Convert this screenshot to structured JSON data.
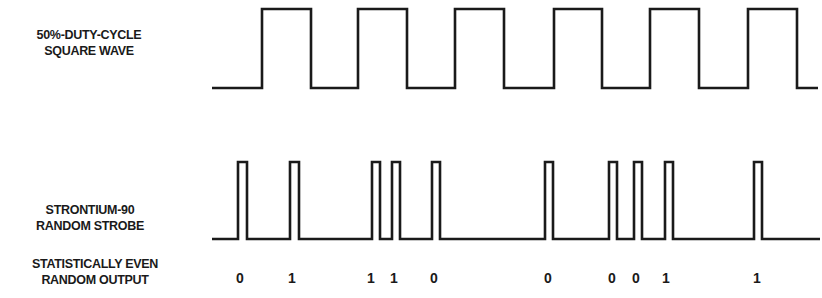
{
  "labels": {
    "square_wave": [
      "50%-DUTY-CYCLE",
      "SQUARE WAVE"
    ],
    "strobe": [
      "STRONTIUM-90",
      "RANDOM STROBE"
    ],
    "output": [
      "STATISTICALLY EVEN",
      "RANDOM OUTPUT"
    ]
  },
  "square_wave": {
    "start_x": 212,
    "end_x": 818,
    "low_y": 88,
    "high_y": 9,
    "edges": [
      262,
      311,
      358,
      407,
      455,
      504,
      554,
      602,
      650,
      699,
      748,
      797
    ]
  },
  "strobe": {
    "start_x": 212,
    "end_x": 820,
    "low_y": 239,
    "high_y": 162,
    "pulses": [
      [
        238,
        247
      ],
      [
        290,
        299
      ],
      [
        372,
        380
      ],
      [
        392,
        400
      ],
      [
        432,
        440
      ],
      [
        545,
        553
      ],
      [
        609,
        617
      ],
      [
        634,
        642
      ],
      [
        665,
        673
      ],
      [
        754,
        762
      ]
    ]
  },
  "output_bits": [
    {
      "x": 240,
      "value": "0"
    },
    {
      "x": 292,
      "value": "1"
    },
    {
      "x": 371,
      "value": "1"
    },
    {
      "x": 394,
      "value": "1"
    },
    {
      "x": 434,
      "value": "0"
    },
    {
      "x": 548,
      "value": "0"
    },
    {
      "x": 612,
      "value": "0"
    },
    {
      "x": 636,
      "value": "0"
    },
    {
      "x": 666,
      "value": "1"
    },
    {
      "x": 757,
      "value": "1"
    }
  ],
  "colors": {
    "ink": "#1a1a1a",
    "background": "#ffffff"
  }
}
